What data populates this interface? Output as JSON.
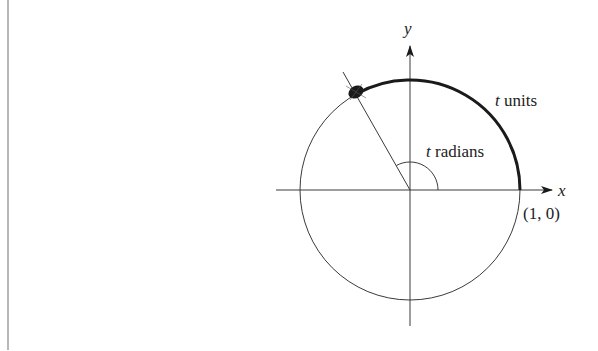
{
  "diagram": {
    "axes": {
      "x_label": "x",
      "y_label": "y"
    },
    "point_label": "(1, 0)",
    "arc_label": {
      "var": "t",
      "text": " units"
    },
    "angle_label": {
      "var": "t",
      "text": " radians"
    },
    "colors": {
      "line": "#3a3a3a",
      "thick_arc": "#1a1a1a",
      "rule": "#b8b8b8"
    }
  }
}
